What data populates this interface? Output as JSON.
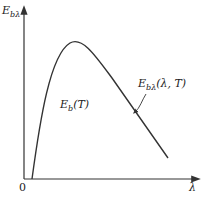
{
  "diagram": {
    "y_axis_label": "E",
    "y_axis_sub": "bλ",
    "x_axis_label": "λ",
    "origin_label": "0",
    "area_label": "E",
    "area_sub": "b",
    "area_arg": "(T)",
    "curve_label": "E",
    "curve_sub": "bλ",
    "curve_arg": "(λ, T)",
    "line_color": "#333333"
  }
}
